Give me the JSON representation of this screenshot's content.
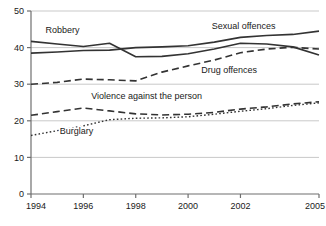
{
  "chart_data": {
    "type": "line",
    "title": "",
    "subtitle": "",
    "xlabel": "",
    "ylabel": "",
    "grid": true,
    "grid_axis": "y",
    "legend_position": "inline-annotations",
    "x": [
      1994,
      1995,
      1996,
      1997,
      1998,
      1999,
      2000,
      2001,
      2002,
      2003,
      2004,
      2005
    ],
    "xlim": [
      1994,
      2005
    ],
    "ylim": [
      0,
      50
    ],
    "x_tick_labels": [
      "1994",
      "1996",
      "1998",
      "2000",
      "2002",
      "2005"
    ],
    "x_tick_values": [
      1994,
      1996,
      1998,
      2000,
      2002,
      2005
    ],
    "y_tick_labels": [
      "0",
      "10",
      "20",
      "30",
      "40",
      "50"
    ],
    "y_tick_values": [
      0,
      10,
      20,
      30,
      40,
      50
    ],
    "series": [
      {
        "name": "Robbery",
        "style": "solid",
        "color": "#333333",
        "label": "Robbery",
        "label_x": 1994.55,
        "label_y": 44.0,
        "values": [
          41.7,
          41.0,
          40.3,
          41.2,
          37.5,
          37.6,
          38.3,
          39.6,
          41.2,
          41.0,
          40.2,
          38.0
        ]
      },
      {
        "name": "Sexual offences",
        "style": "solid",
        "color": "#333333",
        "label": "Sexual offences",
        "label_x": 2000.9,
        "label_y": 45.2,
        "values": [
          38.5,
          38.8,
          39.2,
          39.3,
          40.0,
          40.2,
          40.5,
          41.5,
          42.8,
          43.3,
          43.6,
          44.5
        ]
      },
      {
        "name": "Drug offences",
        "style": "dashed",
        "color": "#333333",
        "label": "Drug offences",
        "label_x": 2000.5,
        "label_y": 33.0,
        "values": [
          30.0,
          30.5,
          31.4,
          31.2,
          30.9,
          33.3,
          35.0,
          36.6,
          38.6,
          39.6,
          40.1,
          39.6
        ]
      },
      {
        "name": "Violence against the person",
        "style": "dashed",
        "color": "#333333",
        "label": "Violence against the person",
        "label_x": 1996.3,
        "label_y": 26.0,
        "values": [
          21.5,
          22.5,
          23.5,
          22.7,
          21.9,
          21.6,
          21.8,
          22.3,
          23.2,
          23.8,
          24.6,
          25.2
        ]
      },
      {
        "name": "Burglary",
        "style": "dotted",
        "color": "#333333",
        "label": "Burglary",
        "label_x": 1995.1,
        "label_y": 16.5,
        "values": [
          16.0,
          17.3,
          18.6,
          20.3,
          20.7,
          20.8,
          21.1,
          21.8,
          22.6,
          23.3,
          24.2,
          24.9
        ]
      }
    ]
  },
  "axes": {
    "axis_color": "#6f6f6f",
    "grid_color": "#c9c9c9"
  }
}
